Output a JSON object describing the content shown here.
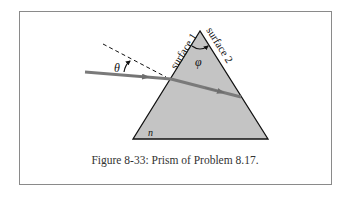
{
  "figure": {
    "caption": "Figure 8-33:  Prism of Problem 8.17.",
    "labels": {
      "surface1": "surface 1",
      "surface2": "surface 2",
      "apex_angle": "φ",
      "incidence_angle": "θ",
      "refractive_index": "n"
    },
    "colors": {
      "prism_fill": "#c4c4c4",
      "ray": "#7a7a7a",
      "outline": "#111111",
      "frame": "#8a8a8a"
    }
  }
}
